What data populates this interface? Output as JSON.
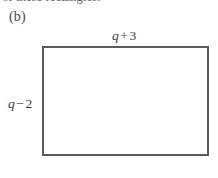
{
  "page": {
    "background_color": "#fefefe",
    "ink_color": "#4a4a4a"
  },
  "header": {
    "clipped_text": "ch of these rectangles."
  },
  "part": {
    "label": "(b)"
  },
  "figure": {
    "type": "rectangle",
    "stroke_color": "#5b5b5b",
    "fill_color": "#ffffff",
    "stroke_width_px": 2,
    "top_label": {
      "variable": "q",
      "operator": "+",
      "constant": "3",
      "full": "q + 3"
    },
    "left_label": {
      "variable": "q",
      "operator": "−",
      "constant": "2",
      "full": "q − 2"
    }
  }
}
